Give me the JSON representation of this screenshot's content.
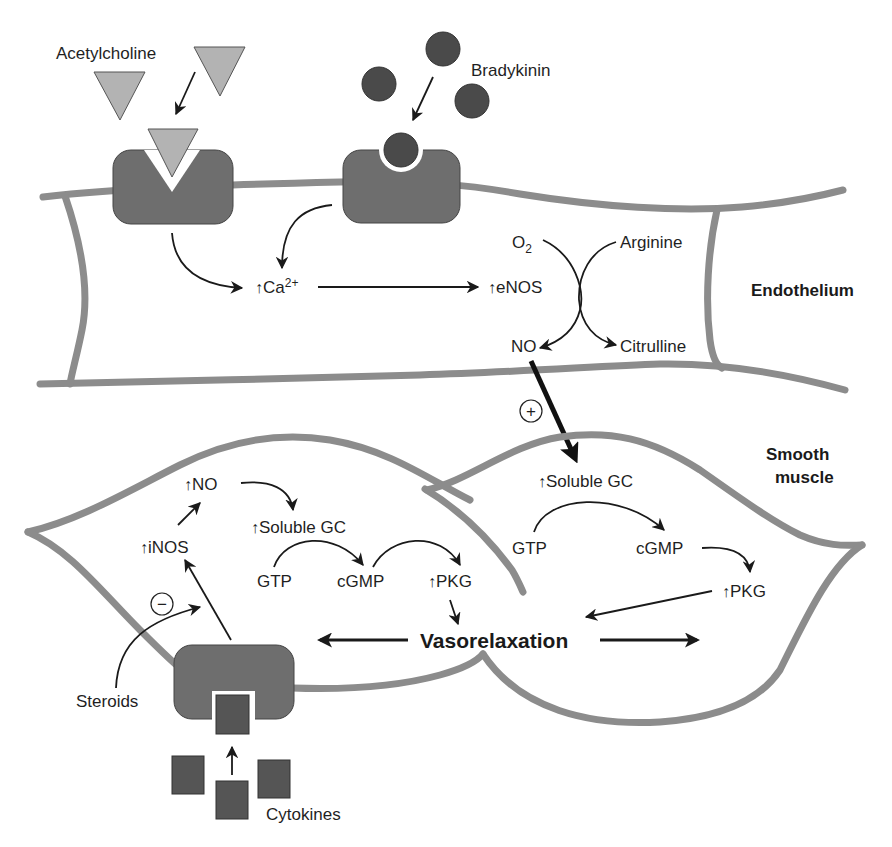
{
  "diagram": {
    "colors": {
      "membrane": "#8c8c8c",
      "receptor": "#6e6e6e",
      "acetylcholine_ligand": "#b3b3b3",
      "bradykinin_ligand": "#4a4a4a",
      "cytokine_ligand": "#555555",
      "text": "#1f1f1f"
    },
    "regions": {
      "endothelium": "Endothelium",
      "smooth_muscle_line1": "Smooth",
      "smooth_muscle_line2": "muscle"
    },
    "ligands": {
      "acetylcholine": "Acetylcholine",
      "bradykinin": "Bradykinin",
      "steroids": "Steroids",
      "cytokines": "Cytokines"
    },
    "endothelium_pathway": {
      "up_arrow": "↑",
      "calcium": "Ca",
      "calcium_charge": "2+",
      "enos": "eNOS",
      "oxygen": "O",
      "oxygen_sub": "2",
      "arginine": "Arginine",
      "no": "NO",
      "citrulline": "Citrulline"
    },
    "stimulation_sign": "+",
    "inhibition_sign": "−",
    "smooth_muscle_left": {
      "no": "NO",
      "inos": "iNOS",
      "soluble_gc": "Soluble GC",
      "gtp": "GTP",
      "cgmp": "cGMP",
      "pkg": "PKG"
    },
    "smooth_muscle_right": {
      "soluble_gc": "Soluble GC",
      "gtp": "GTP",
      "cgmp": "cGMP",
      "pkg": "PKG"
    },
    "outcome": "Vasorelaxation"
  }
}
